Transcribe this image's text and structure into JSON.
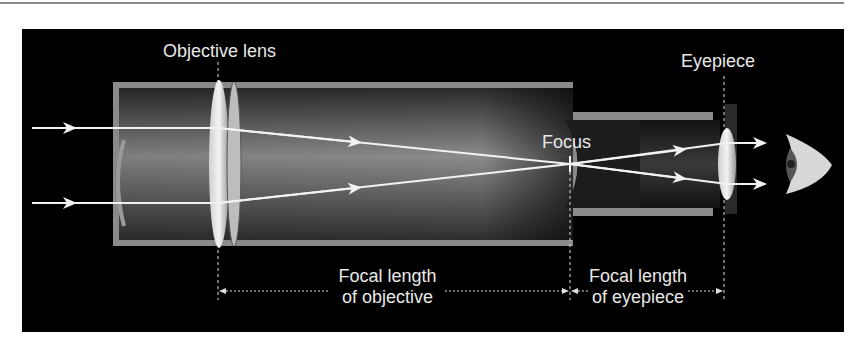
{
  "diagram": {
    "type": "refracting-telescope",
    "labels": {
      "objective_lens": "Objective lens",
      "eyepiece": "Eyepiece",
      "focus": "Focus",
      "focal_objective_line1": "Focal length",
      "focal_objective_line2": "of objective",
      "focal_eyepiece_line1": "Focal length",
      "focal_eyepiece_line2": "of eyepiece"
    },
    "colors": {
      "background": "#000000",
      "tube_wall": "#8a8a8a",
      "ray": "#f2f2f2",
      "label": "#e8e8e8"
    }
  }
}
